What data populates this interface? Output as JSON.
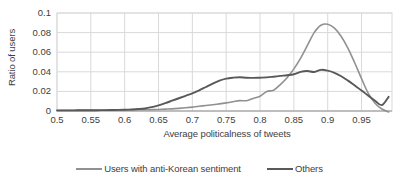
{
  "chart_data": {
    "type": "line",
    "title": "",
    "xlabel": "Average politicalness of tweets",
    "ylabel": "Ratio of users",
    "xlim": [
      0.5,
      0.995
    ],
    "ylim": [
      0,
      0.1
    ],
    "grid": true,
    "legend_position": "bottom",
    "x_ticks": [
      "0.5",
      "0.55",
      "0.6",
      "0.65",
      "0.7",
      "0.75",
      "0.8",
      "0.85",
      "0.9",
      "0.95"
    ],
    "x_tick_values": [
      0.5,
      0.55,
      0.6,
      0.65,
      0.7,
      0.75,
      0.8,
      0.85,
      0.9,
      0.95
    ],
    "y_ticks": [
      "0",
      "0.02",
      "0.04",
      "0.06",
      "0.08",
      "0.1"
    ],
    "y_tick_values": [
      0,
      0.02,
      0.04,
      0.06,
      0.08,
      0.1
    ],
    "x": [
      0.5,
      0.51,
      0.52,
      0.53,
      0.54,
      0.55,
      0.56,
      0.57,
      0.58,
      0.59,
      0.6,
      0.61,
      0.62,
      0.63,
      0.64,
      0.65,
      0.66,
      0.67,
      0.68,
      0.69,
      0.7,
      0.71,
      0.72,
      0.73,
      0.74,
      0.75,
      0.76,
      0.77,
      0.78,
      0.79,
      0.8,
      0.81,
      0.82,
      0.83,
      0.84,
      0.85,
      0.86,
      0.87,
      0.88,
      0.89,
      0.9,
      0.91,
      0.92,
      0.93,
      0.94,
      0.95,
      0.96,
      0.97,
      0.98,
      0.99
    ],
    "series": [
      {
        "name": "Users with anti-Korean sentiment",
        "color": "#919191",
        "values": [
          0.0005,
          0.0005,
          0.0005,
          0.0006,
          0.0006,
          0.0006,
          0.0007,
          0.0007,
          0.0008,
          0.0009,
          0.001,
          0.0011,
          0.0012,
          0.0013,
          0.0014,
          0.0016,
          0.0019,
          0.0022,
          0.0027,
          0.0033,
          0.004,
          0.0048,
          0.0056,
          0.0064,
          0.0073,
          0.0083,
          0.0094,
          0.0106,
          0.0105,
          0.0128,
          0.015,
          0.02,
          0.0212,
          0.027,
          0.034,
          0.043,
          0.054,
          0.067,
          0.08,
          0.0875,
          0.0885,
          0.0845,
          0.076,
          0.064,
          0.049,
          0.033,
          0.018,
          0.008,
          0.002,
          -0.001
        ]
      },
      {
        "name": "Others",
        "color": "#595959",
        "values": [
          0.0006,
          0.0006,
          0.0006,
          0.0007,
          0.0007,
          0.0008,
          0.0008,
          0.0009,
          0.001,
          0.0011,
          0.0013,
          0.0016,
          0.002,
          0.0026,
          0.004,
          0.0058,
          0.008,
          0.0105,
          0.013,
          0.0155,
          0.018,
          0.021,
          0.0245,
          0.028,
          0.031,
          0.033,
          0.034,
          0.0345,
          0.034,
          0.0338,
          0.034,
          0.0343,
          0.035,
          0.0358,
          0.0365,
          0.0375,
          0.04,
          0.0408,
          0.0398,
          0.042,
          0.0412,
          0.039,
          0.0355,
          0.031,
          0.026,
          0.021,
          0.0155,
          0.0105,
          0.006,
          0.0145
        ]
      }
    ]
  }
}
